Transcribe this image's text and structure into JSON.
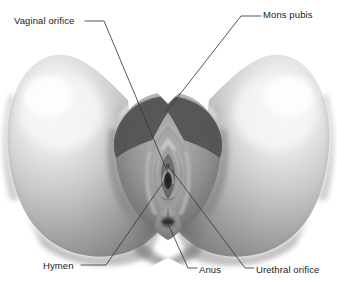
{
  "figure": {
    "background_color": "#ffffff",
    "width": 337,
    "height": 281,
    "line_color": "#3a3a3a",
    "text_color": "#1b1b1b"
  },
  "labels": {
    "vaginal_orifice": "Vaginal orifice",
    "mons_pubis": "Mons pubis",
    "hymen": "Hymen",
    "anus": "Anus",
    "urethral_orifice": "Urethral orifice"
  },
  "anatomy": {
    "left_thigh": "left-thigh",
    "right_thigh": "right-thigh",
    "mons_pubis_region": "mons-pubis-region",
    "pubic_hair": "pubic-hair",
    "labia_majora": "labia-majora",
    "labia_minora": "labia-minora",
    "vaginal_opening": "vaginal-opening",
    "perineum": "perineum",
    "anus_region": "anus-region"
  }
}
